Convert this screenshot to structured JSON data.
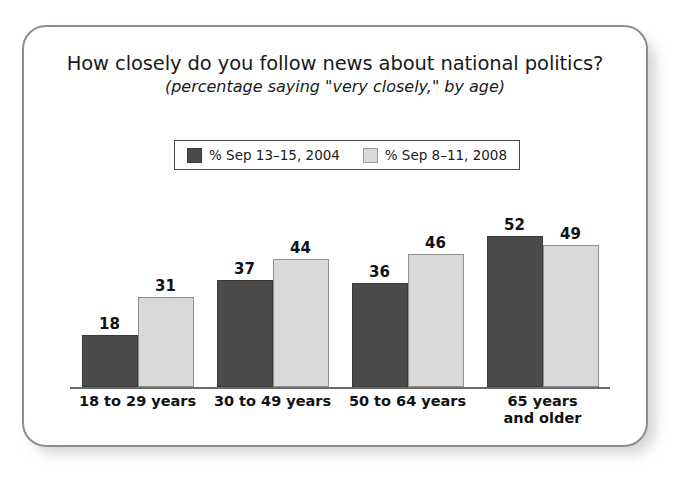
{
  "card": {
    "border_color": "#8d8d8d",
    "background": "#ffffff"
  },
  "title": {
    "main": "How closely do you follow news about national politics?",
    "sub": "(percentage saying \"very closely,\" by age)"
  },
  "legend": {
    "position": "top-center",
    "entries": [
      {
        "label": "% Sep 13–15, 2004",
        "color": "#4b4b4b"
      },
      {
        "label": "% Sep 8–11, 2008",
        "color": "#d9d9d9"
      }
    ]
  },
  "chart_data": {
    "type": "bar",
    "title": "How closely do you follow news about national politics?",
    "subtitle": "(percentage saying \"very closely,\" by age)",
    "xlabel": "",
    "ylabel": "",
    "ylim": [
      0,
      60
    ],
    "grid": false,
    "legend_position": "top-center",
    "categories": [
      "18 to 29 years",
      "30 to 49 years",
      "50 to 64 years",
      "65 years\nand older"
    ],
    "series": [
      {
        "name": "% Sep 13–15, 2004",
        "color": "#4b4b4b",
        "values": [
          18,
          37,
          36,
          52
        ]
      },
      {
        "name": "% Sep 8–11, 2008",
        "color": "#d9d9d9",
        "values": [
          31,
          44,
          46,
          49
        ]
      }
    ],
    "data_labels": [
      [
        "18",
        "31"
      ],
      [
        "37",
        "44"
      ],
      [
        "36",
        "46"
      ],
      [
        "52",
        "49"
      ]
    ]
  }
}
